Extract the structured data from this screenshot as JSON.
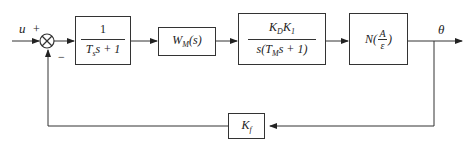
{
  "signals": {
    "input": "u",
    "output": "θ",
    "plus_sign": "+",
    "minus_sign": "−"
  },
  "blocks": {
    "b1": {
      "numerator": "1",
      "denominator_pre": "T",
      "denominator_sub": "s",
      "denominator_post": "s + 1"
    },
    "b2": {
      "pre": "W",
      "sub": "M",
      "post": "(s)"
    },
    "b3": {
      "num_a": "K",
      "num_a_sub": "D",
      "num_b": "K",
      "num_b_sub": "1",
      "den_pre": "s(T",
      "den_sub": "M",
      "den_post": "s + 1)"
    },
    "b4": {
      "pre": "N(",
      "frac_num": "A",
      "frac_den": "ε",
      "post": ")"
    },
    "feedback": {
      "pre": "K",
      "sub": "f"
    }
  }
}
